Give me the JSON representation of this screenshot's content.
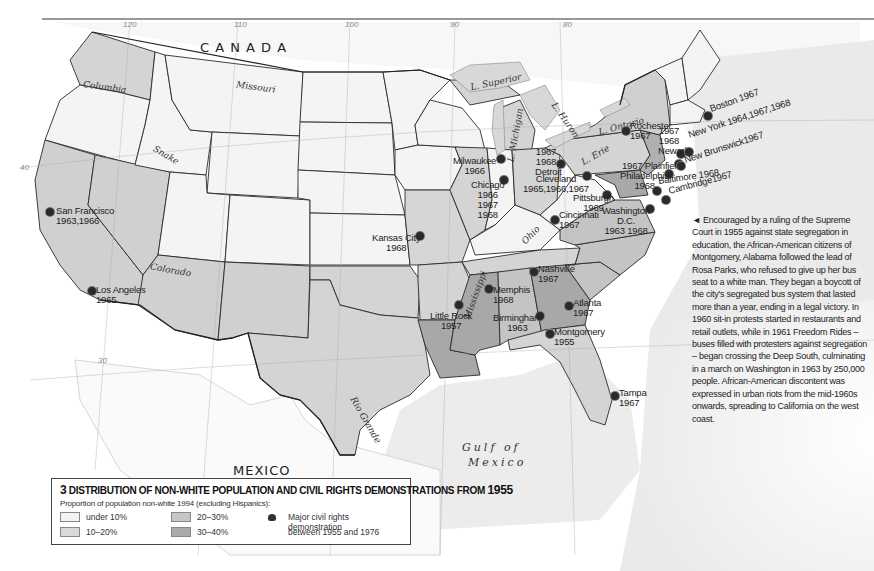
{
  "map": {
    "countries": {
      "canada": "C  A  N  A  D  A",
      "mexico": "MEXICO"
    },
    "water_bodies": {
      "gulf_line1": "Gulf of",
      "gulf_line2": "Mexico",
      "lake_superior": "L. Superior",
      "lake_michigan": "L. Michigan",
      "lake_huron": "L. Huron",
      "lake_erie": "L. Erie",
      "lake_ontario": "L. Ontario"
    },
    "rivers": {
      "columbia": "Columbia",
      "missouri": "Missouri",
      "snake": "Snake",
      "colorado": "Colorado",
      "rio_grande": "Rio Grande",
      "mississippi": "Mississippi",
      "ohio": "Ohio"
    },
    "graticule": {
      "lon120": "120",
      "lon110": "110",
      "lon100": "100",
      "lon90": "90",
      "lon80": "80",
      "lat40": "40",
      "lat30": "30"
    },
    "demonstrations": [
      {
        "city": "San Francisco",
        "years": "1963,1966"
      },
      {
        "city": "Los Angeles",
        "years": "1965"
      },
      {
        "city": "Kansas City",
        "years": "1968"
      },
      {
        "city": "Milwaukee",
        "years": "1966"
      },
      {
        "city": "Chicago",
        "years": "1966\n1967\n1968"
      },
      {
        "city": "Detroit",
        "years": "1967 1968"
      },
      {
        "city": "Cleveland",
        "years": "1965,1966,1967"
      },
      {
        "city": "Cincinnati",
        "years": "1967"
      },
      {
        "city": "Pittsburgh",
        "years": "1969"
      },
      {
        "city": "Washington D.C.",
        "years": "1963 1968"
      },
      {
        "city": "Rochester",
        "years": "1967"
      },
      {
        "city": "Newark",
        "years": "1967 1968"
      },
      {
        "city": "Plainfield",
        "years": "1967"
      },
      {
        "city": "Philadelphia",
        "years": "1968"
      },
      {
        "city": "New York",
        "years": "1964,1967,1968"
      },
      {
        "city": "New Brunswick",
        "years": "1967"
      },
      {
        "city": "Baltimore",
        "years": "1968"
      },
      {
        "city": "Cambridge",
        "years": "1967"
      },
      {
        "city": "Boston",
        "years": "1967"
      },
      {
        "city": "Nashville",
        "years": "1967"
      },
      {
        "city": "Memphis",
        "years": "1968"
      },
      {
        "city": "Little Rock",
        "years": "1957"
      },
      {
        "city": "Birmingham",
        "years": "1963"
      },
      {
        "city": "Atlanta",
        "years": "1967"
      },
      {
        "city": "Montgomery",
        "years": "1955"
      },
      {
        "city": "Tampa",
        "years": "1967"
      }
    ],
    "colors": {
      "under10": "#f4f4f4",
      "10to20": "#d9d9d9",
      "20to30": "#c6c6c6",
      "30to40": "#a9a9a9",
      "water": "#e6e6e6",
      "border": "#2a2a2a"
    }
  },
  "caption": {
    "text": "Encouraged by a ruling of the Supreme Court in 1955 against state segregation in education, the African-American citizens of Montgomery, Alabama followed the lead of Rosa Parks, who refused to give up her bus seat to a white man. They began a boycott of the city's segregated bus system that lasted more than a year, ending in a legal victory. In 1960 sit-in protests started in restaurants and retail outlets, while in 1961 Freedom Rides – buses filled with protesters against segregation – began crossing the Deep South, culminating in a march on Washington in 1963 by 250,000 people. African-American discontent was expressed in urban riots from the mid-1960s onwards, spreading to California on the west coast.",
    "pointer": "◄"
  },
  "legend": {
    "number": "3",
    "title": "DISTRIBUTION OF NON-WHITE POPULATION AND CIVIL RIGHTS DEMONSTRATIONS FROM",
    "year": "1955",
    "subtitle": "Proportion of population non-white 1994 (excluding Hispanics):",
    "classes": [
      {
        "label": "under 10%"
      },
      {
        "label": "10–20%"
      },
      {
        "label": "20–30%"
      },
      {
        "label": "30–40%"
      }
    ],
    "symbol_label_1": "Major civil rights demonstration",
    "symbol_label_2": "between 1955 and 1976"
  }
}
